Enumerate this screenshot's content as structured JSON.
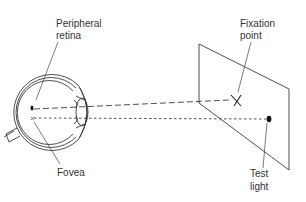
{
  "diagram": {
    "type": "perimetry-visual-field-test",
    "labels": {
      "peripheral_retina": [
        "Peripheral",
        "retina"
      ],
      "fovea": [
        "Fovea"
      ],
      "fixation_point": [
        "Fixation",
        "point"
      ],
      "test_light": [
        "Test",
        "light"
      ]
    },
    "elements": {
      "eye": "eye-cross-section",
      "screen": "tangent-screen",
      "fixation_marker": "X",
      "test_light_marker": "dot"
    },
    "colors": {
      "line": "#222222",
      "text": "#333333",
      "background": "#ffffff"
    }
  }
}
